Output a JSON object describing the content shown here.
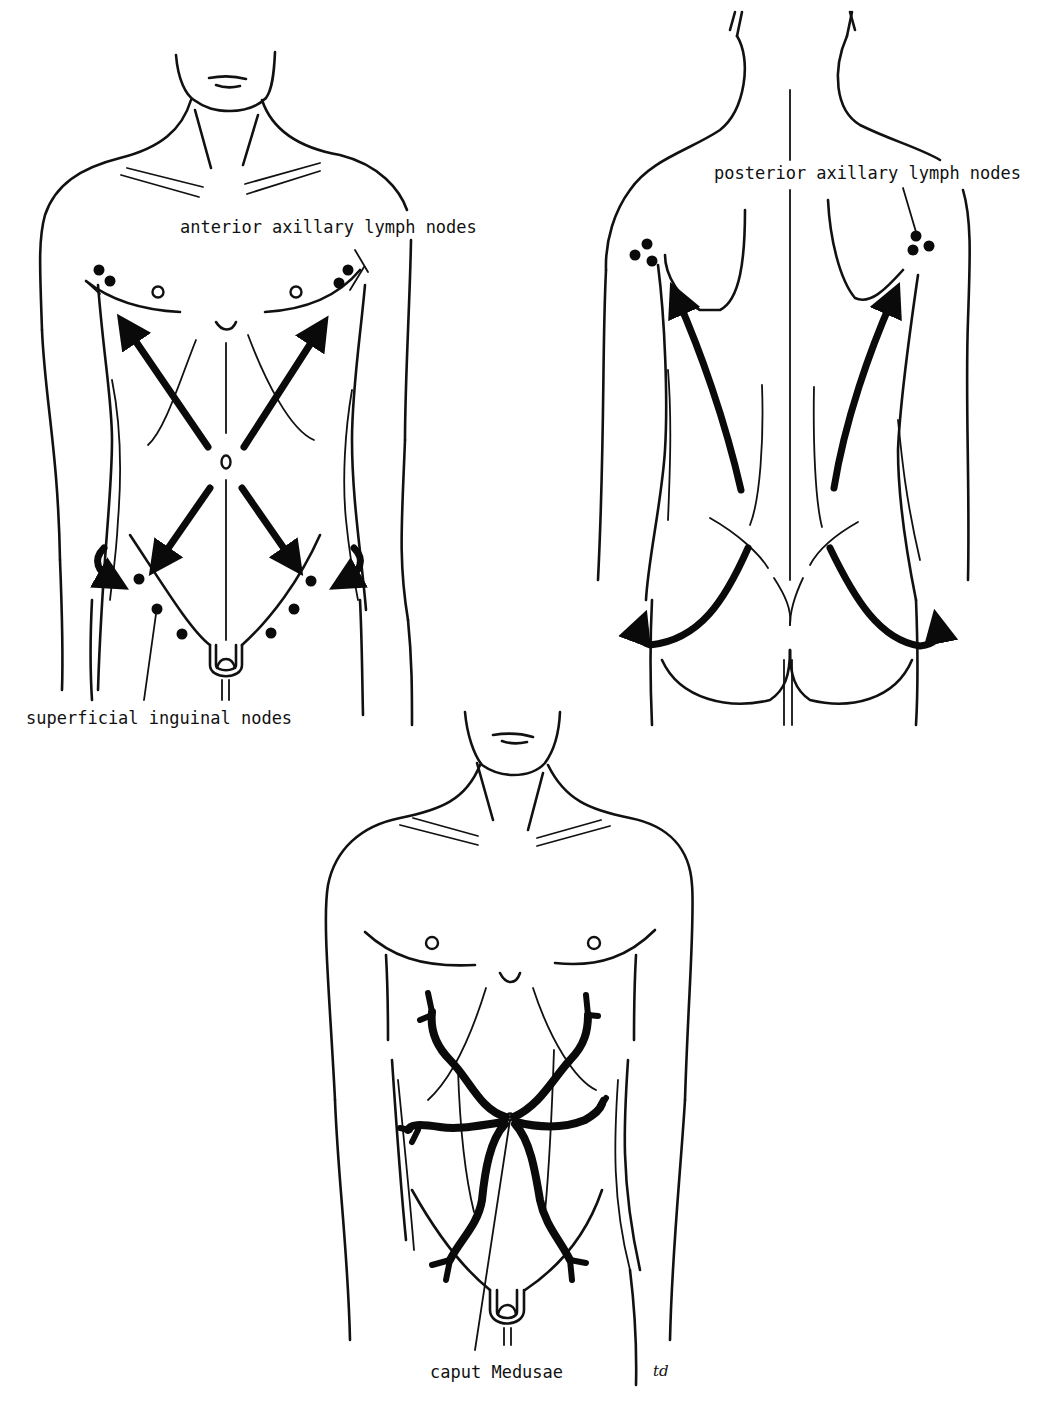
{
  "figure": {
    "panels": [
      {
        "id": "anterior-view",
        "description": "Front of male torso showing lymphatic drainage of skin toward axillary and inguinal nodes",
        "labels": {
          "axillary": "anterior axillary lymph nodes",
          "inguinal": "superficial inguinal nodes"
        }
      },
      {
        "id": "posterior-view",
        "description": "Back of torso showing lymphatic drainage toward posterior axillary nodes and around the buttocks",
        "labels": {
          "axillary": "posterior axillary lymph nodes"
        }
      },
      {
        "id": "caput-medusae-view",
        "description": "Front of male torso showing dilated veins radiating from the umbilicus",
        "labels": {
          "veins": "caput Medusae"
        }
      }
    ],
    "signature": "td",
    "colors": {
      "line": "#111111",
      "background": "#ffffff"
    }
  }
}
